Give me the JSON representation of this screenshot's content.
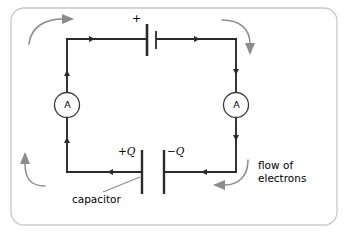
{
  "figure": {
    "background_color": "#ffffff",
    "border_color": "#c9c9c9",
    "wire_color": "#2b2b2b",
    "arrow_color": "#8b8b8b"
  },
  "components": {
    "battery": {
      "name": "battery",
      "polarity_label": "+"
    },
    "capacitor": {
      "name": "capacitor",
      "caption": "capacitor",
      "left_plate_label": "+Q",
      "right_plate_label": "−Q"
    },
    "ammeter_left": {
      "symbol": "A"
    },
    "ammeter_right": {
      "symbol": "A"
    }
  },
  "annotations": {
    "flow_line_1": "flow of",
    "flow_line_2": "electrons"
  }
}
